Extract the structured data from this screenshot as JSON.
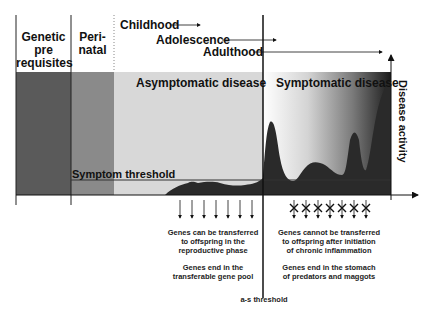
{
  "header": {
    "genetic": [
      "Genetic",
      "pre",
      "requisites"
    ],
    "perinatal": [
      "Peri-",
      "natal"
    ],
    "childhood": "Childhood",
    "adolescence": "Adolescence",
    "adulthood": "Adulthood"
  },
  "bands": {
    "asymptomatic": "Asymptomatic disease",
    "symptomatic": "Symptomatic disease"
  },
  "axes": {
    "y_label": "Disease activity",
    "symptom_threshold": "Symptom threshold",
    "as_threshold": "a-s threshold"
  },
  "notes": {
    "left": {
      "line1": [
        "Genes can be transferred",
        "to offspring in the",
        "reproductive phase"
      ],
      "line2": [
        "Genes end in the",
        "transferable gene pool"
      ]
    },
    "right": {
      "line1": [
        "Genes cannot be transferred",
        "to offspring after initiation",
        "of chronic inflammation"
      ],
      "line2": [
        "Genes end in the stomach",
        "of predators and maggots"
      ]
    }
  },
  "colors": {
    "genetic_band": "#5a5a5a",
    "perinatal_band": "#8a8a8a",
    "asymptomatic_band": "#d8d8d8",
    "curve_fill": "#2a2a2a",
    "line": "#222222"
  }
}
